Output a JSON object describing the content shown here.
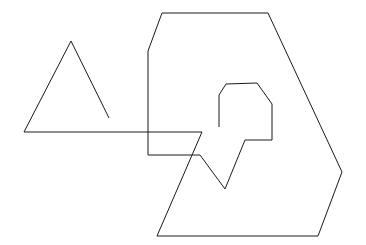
{
  "figure": {
    "type": "line-drawing",
    "canvas": {
      "width": 366,
      "height": 245
    },
    "background_color": "#ffffff",
    "stroke_color": "#1a1a1a",
    "stroke_width": 1,
    "shapes": [
      {
        "name": "triangle-with-tail",
        "closed": false,
        "points": [
          [
            109,
            118
          ],
          [
            71,
            41
          ],
          [
            24,
            132
          ],
          [
            202,
            132
          ]
        ],
        "points_text": "109,118 71,41 24,132 202,132"
      },
      {
        "name": "inner-zigzag-and-outer-outline",
        "closed": false,
        "points": [
          [
            219,
            127
          ],
          [
            219,
            95
          ],
          [
            226,
            84
          ],
          [
            257,
            83
          ],
          [
            272,
            104
          ],
          [
            272,
            140
          ],
          [
            245,
            140
          ],
          [
            225,
            189
          ],
          [
            200,
            155
          ],
          [
            148,
            155
          ],
          [
            148,
            51
          ],
          [
            162,
            13
          ],
          [
            268,
            13
          ],
          [
            342,
            172
          ],
          [
            318,
            236
          ],
          [
            157,
            236
          ],
          [
            202,
            132
          ]
        ],
        "points_text": "219,127 219,95 226,84 257,83 272,104 272,140 245,140 225,189 200,155 148,155 148,51 162,13 268,13 342,172 318,236 157,236 202,132"
      }
    ]
  }
}
